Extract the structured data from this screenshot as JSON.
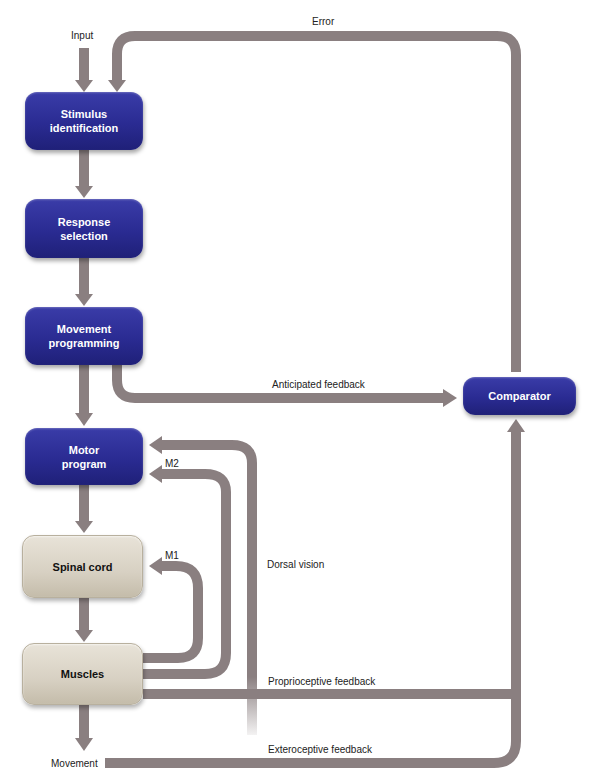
{
  "labels": {
    "input": "Input",
    "error": "Error",
    "anticipated_feedback": "Anticipated feedback",
    "m2": "M2",
    "m1": "M1",
    "dorsal_vision": "Dorsal vision",
    "proprioceptive_feedback": "Proprioceptive feedback",
    "exteroceptive_feedback": "Exteroceptive feedback",
    "movement": "Movement"
  },
  "boxes": {
    "stimulus": {
      "line1": "Stimulus",
      "line2": "identification"
    },
    "response": {
      "line1": "Response",
      "line2": "selection"
    },
    "movement_programming": {
      "line1": "Movement",
      "line2": "programming"
    },
    "motor_program": {
      "line1": "Motor",
      "line2": "program"
    },
    "spinal_cord": {
      "line1": "Spinal cord"
    },
    "muscles": {
      "line1": "Muscles"
    },
    "comparator": {
      "line1": "Comparator"
    }
  },
  "colors": {
    "arrow": "#8a7f80",
    "blue_box": "#2a2b92",
    "beige_box": "#d7d0c2"
  }
}
